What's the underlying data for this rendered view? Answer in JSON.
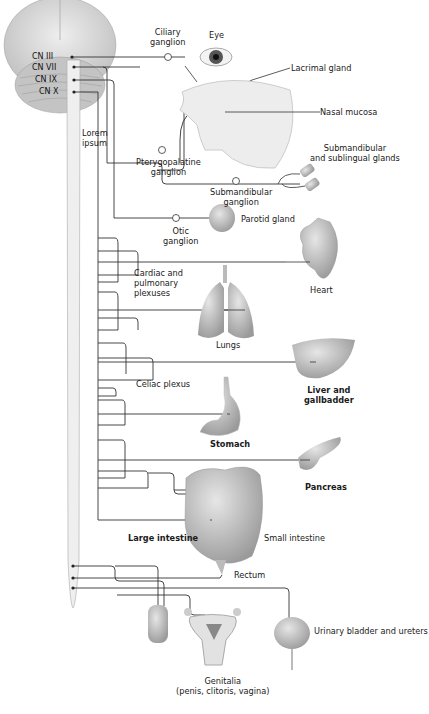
{
  "diagram": {
    "type": "anatomical-pathway",
    "cranial_nerves": [
      "CN III",
      "CN VII",
      "CN IX",
      "CN X"
    ],
    "nerve_label": "Lorem ipsum",
    "ganglia": {
      "ciliary": "Ciliary ganglion",
      "pterygopalatine": "Pterygopalatine ganglion",
      "submandibular": "Submandibular ganglion",
      "otic": "Otic ganglion"
    },
    "plexuses": {
      "cardiac_pulmonary": "Cardiac and pulmonary plexuses",
      "celiac": "Celiac plexus"
    },
    "targets": {
      "eye": "Eye",
      "lacrimal": "Lacrimal gland",
      "nasal": "Nasal mucosa",
      "submandibular_sublingual": "Submandibular and sublingual glands",
      "parotid": "Parotid gland",
      "heart": "Heart",
      "lungs": "Lungs",
      "liver": "Liver and gallbadder",
      "stomach": "Stomach",
      "pancreas": "Pancreas",
      "large_intestine": "Large intestine",
      "small_intestine": "Small intestine",
      "rectum": "Rectum",
      "bladder": "Urinary bladder and ureters",
      "genitalia": "Genitalia",
      "genitalia_detail": "(penis, clitoris, vagina)"
    },
    "label_lines": {
      "ciliary_1": "Ciliary",
      "ciliary_2": "ganglion",
      "ptery_1": "Pterygopalatine",
      "ptery_2": "ganglion",
      "submand_1": "Submandibular",
      "submand_2": "ganglion",
      "otic_1": "Otic",
      "otic_2": "ganglion",
      "sub_sub_1": "Submandibular",
      "sub_sub_2": "and sublingual glands",
      "cardiac_1": "Cardiac and",
      "cardiac_2": "pulmonary",
      "cardiac_3": "plexuses",
      "liver_1": "Liver and",
      "liver_2": "gallbadder",
      "lorem_1": "Lorem",
      "lorem_2": "ipsum"
    },
    "colors": {
      "line": "#333333",
      "organ_fill": "#b8b8b8",
      "brain_fill": "#d6d6d6",
      "cord_fill": "#ececec"
    }
  }
}
